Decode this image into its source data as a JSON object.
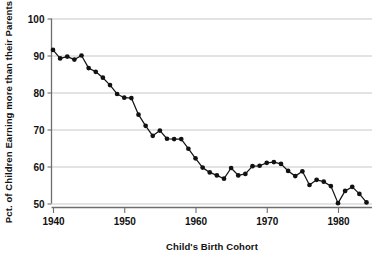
{
  "chart_data": {
    "type": "line",
    "title": "",
    "xlabel": "Child's Birth Cohort",
    "ylabel": "Pct. of Children Earning more than their Parents",
    "xlim": [
      1939,
      1985
    ],
    "ylim": [
      48,
      101
    ],
    "xticks": [
      1940,
      1950,
      1960,
      1970,
      1980
    ],
    "xtick_labels": [
      "1940",
      "1950",
      "1960",
      "1970",
      "1980"
    ],
    "yticks": [
      50,
      60,
      70,
      80,
      90,
      100
    ],
    "ytick_labels": [
      "50",
      "60",
      "70",
      "80",
      "90",
      "100"
    ],
    "grid": "horizontal",
    "legend": "none",
    "marker": "filled-circle",
    "line_color": "#111111",
    "grid_color": "#b9b9b9",
    "x": [
      1940,
      1941,
      1942,
      1943,
      1944,
      1945,
      1946,
      1947,
      1948,
      1949,
      1950,
      1951,
      1952,
      1953,
      1954,
      1955,
      1956,
      1957,
      1958,
      1959,
      1960,
      1961,
      1962,
      1963,
      1964,
      1965,
      1966,
      1967,
      1968,
      1969,
      1970,
      1971,
      1972,
      1973,
      1974,
      1975,
      1976,
      1977,
      1978,
      1979,
      1980,
      1981,
      1982,
      1983,
      1984
    ],
    "values": [
      91.5,
      89.2,
      89.7,
      88.9,
      90.0,
      86.6,
      85.6,
      84.0,
      82.0,
      79.6,
      78.6,
      78.5,
      74.0,
      71.0,
      68.3,
      69.7,
      67.5,
      67.4,
      67.4,
      64.8,
      62.2,
      59.7,
      58.4,
      57.6,
      56.7,
      59.6,
      57.6,
      58.0,
      60.1,
      60.2,
      61.0,
      61.2,
      60.7,
      58.8,
      57.4,
      58.7,
      55.0,
      56.4,
      55.9,
      54.7,
      50.1,
      53.4,
      54.5,
      52.6,
      50.3
    ],
    "series_name": "Absolute income mobility by child's birth cohort",
    "units": "percent"
  },
  "labels": {
    "y_axis_title": "Pct. of Children Earning more than their Parents",
    "x_axis_title": "Child's Birth Cohort"
  }
}
